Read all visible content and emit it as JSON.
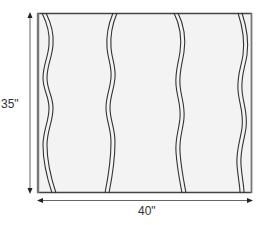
{
  "diagram": {
    "type": "quilt-panel-layout",
    "panel": {
      "width_label": "40\"",
      "height_label": "35\"",
      "fill_color": "#f3f3f3",
      "line_color": "#333333",
      "edge_color": "#666666"
    },
    "strips": [
      {
        "name": "left-edge-strip"
      },
      {
        "name": "panel-1"
      },
      {
        "name": "panel-2"
      },
      {
        "name": "panel-3"
      },
      {
        "name": "right-edge-strip"
      }
    ],
    "dimensions": {
      "vertical": {
        "label": "35\"",
        "orientation": "vertical"
      },
      "horizontal": {
        "label": "40\"",
        "orientation": "horizontal"
      }
    }
  }
}
